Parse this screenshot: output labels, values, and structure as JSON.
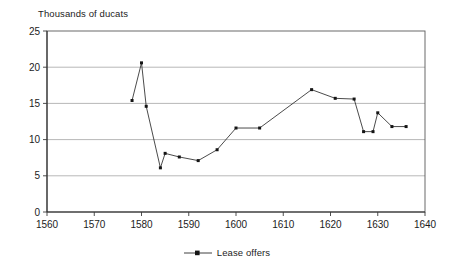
{
  "chart_data": {
    "type": "line",
    "title": "",
    "subtitle": "",
    "xlabel": "",
    "ylabel": "Thousands of ducats",
    "xlim": [
      1560,
      1640
    ],
    "ylim": [
      0,
      25
    ],
    "xticks": [
      1560,
      1570,
      1580,
      1590,
      1600,
      1610,
      1620,
      1630,
      1640
    ],
    "yticks": [
      0,
      5,
      10,
      15,
      20,
      25
    ],
    "grid": "horizontal",
    "legend_position": "bottom-center",
    "series": [
      {
        "name": "Lease offers",
        "marker": "square",
        "color": "#1a1a1a",
        "x": [
          1578,
          1580,
          1581,
          1584,
          1585,
          1588,
          1592,
          1596,
          1600,
          1605,
          1616,
          1621,
          1625,
          1627,
          1629,
          1630,
          1633,
          1636
        ],
        "values": [
          15.4,
          20.6,
          14.6,
          6.1,
          8.1,
          7.6,
          7.1,
          8.6,
          11.6,
          11.6,
          16.9,
          15.7,
          15.6,
          11.1,
          11.1,
          13.7,
          11.8,
          11.8
        ]
      }
    ]
  },
  "legend": {
    "entries": [
      {
        "label": "Lease offers"
      }
    ]
  },
  "axis": {
    "y_title": "Thousands of ducats",
    "y_tick_labels": [
      "25",
      "20",
      "15",
      "10",
      "5",
      "0"
    ],
    "x_tick_labels": [
      "1560",
      "1570",
      "1580",
      "1590",
      "1600",
      "1610",
      "1620",
      "1630",
      "1640"
    ]
  },
  "colors": {
    "line": "#2a2a2a",
    "grid": "#9a9a9a",
    "frame": "#5a5a5a",
    "text": "#1c1c1c",
    "background": "#ffffff"
  }
}
